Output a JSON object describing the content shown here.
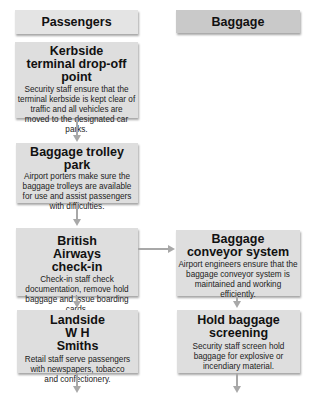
{
  "columns": {
    "passengers": {
      "label": "Passengers"
    },
    "baggage": {
      "label": "Baggage"
    }
  },
  "passenger_steps": [
    {
      "title": "Kerbside terminal drop-off point",
      "description": "Security staff ensure that the terminal kerbside is kept clear of traffic and all vehicles are moved to the designated car parks."
    },
    {
      "title": "Baggage trolley park",
      "description": "Airport porters make sure the baggage trolleys are available for use and assist passengers with difficulties."
    },
    {
      "title": "British Airways check-in",
      "description": "Check-in staff check documentation, remove hold baggage and issue boarding cards."
    },
    {
      "title": "Landside W H Smiths",
      "description": "Retail staff serve passengers with newspapers, tobacco and confectionery."
    }
  ],
  "baggage_steps": [
    {
      "title": "Baggage conveyor system",
      "description": "Airport engineers ensure that the baggage conveyor system is maintained and working efficiently."
    },
    {
      "title": "Hold baggage screening",
      "description": "Security staff screen hold baggage for explosive or incendiary material."
    }
  ],
  "colors": {
    "box": "#dedede",
    "header_passengers": "#e4e4e4",
    "header_baggage": "#c9c9c9",
    "connector": "#a8a8a8"
  }
}
